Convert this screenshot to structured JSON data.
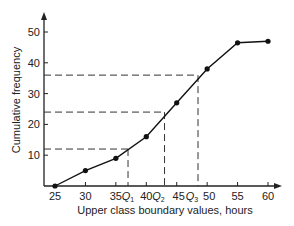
{
  "chart_data": {
    "type": "line",
    "title": "",
    "xlabel": "Upper class boundary values, hours",
    "ylabel": "Cumulative frequency",
    "x": [
      25,
      30,
      35,
      40,
      45,
      50,
      55,
      60
    ],
    "series": [
      {
        "name": "Cumulative frequency",
        "values": [
          0,
          5,
          9,
          16,
          27,
          38,
          46.5,
          47
        ]
      }
    ],
    "xlim": [
      23,
      62
    ],
    "ylim": [
      0,
      55
    ],
    "xticks": [
      25,
      30,
      35,
      40,
      45,
      50,
      55,
      60
    ],
    "yticks": [
      10,
      20,
      30,
      40,
      50
    ],
    "grid": false,
    "annotations": [
      {
        "label": "Q1",
        "x": 37,
        "y": 12
      },
      {
        "label": "Q2",
        "x": 43,
        "y": 24
      },
      {
        "label": "Q3",
        "x": 48.5,
        "y": 36
      }
    ]
  },
  "labels": {
    "xlabel": "Upper class boundary values, hours",
    "ylabel": "Cumulative frequency",
    "q1": "Q",
    "q1_sub": "1",
    "q2": "Q",
    "q2_sub": "2",
    "q3": "Q",
    "q3_sub": "3"
  }
}
